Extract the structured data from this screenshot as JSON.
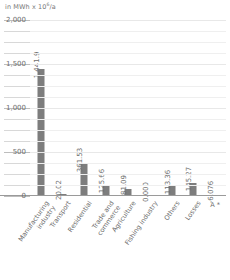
{
  "chart_data": {
    "type": "bar",
    "title_prefix": "in MWh x 10",
    "title_exponent": "6",
    "title_suffix": "/a",
    "xlabel": "",
    "ylabel": "",
    "ylim": [
      0,
      2000
    ],
    "grid": true,
    "legend": "none",
    "y_ticks_major": [
      "2,000",
      "1,500",
      "1,000",
      "500",
      "0"
    ],
    "y_tick_values": [
      2000,
      1500,
      1000,
      500,
      0
    ],
    "y_minor_step": 125,
    "categories": [
      "Manufacturing\nindustry",
      "Transport",
      "Residential",
      "Trade and\ncommerce",
      "Agriculture",
      "Fishing industry",
      "Others",
      "Losses",
      "A *"
    ],
    "values": [
      1441.9,
      20.02,
      361.53,
      125.66,
      81.09,
      0.0,
      113.36,
      145.27,
      -6.076
    ],
    "value_labels": [
      "1,441.9",
      "20.02",
      "361.53",
      "125.66",
      "81.09",
      "0.000",
      "113.36",
      "145.27",
      "-6.076"
    ],
    "bar_color": "#7d7d7d",
    "grid_color": "#e8e8e8",
    "axis_color": "#9a9a9a",
    "text_color": "#6e6e6e"
  }
}
